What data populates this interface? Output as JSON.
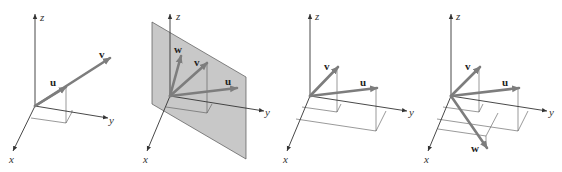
{
  "figure": {
    "colors": {
      "vector": "#7d7d7d",
      "axis": "#333333",
      "plane": "#c8c8c8",
      "background": "#ffffff"
    },
    "panels": [
      {
        "id": "panel-1",
        "axes": {
          "x": "x",
          "y": "y",
          "z": "z"
        },
        "vectors": [
          {
            "name": "u",
            "label": "u"
          },
          {
            "name": "v",
            "label": "v"
          }
        ],
        "note": "u and v are collinear (v is a scalar multiple of u)"
      },
      {
        "id": "panel-2",
        "axes": {
          "x": "x",
          "y": "y",
          "z": "z"
        },
        "vectors": [
          {
            "name": "w",
            "label": "w"
          },
          {
            "name": "v",
            "label": "v"
          },
          {
            "name": "u",
            "label": "u"
          }
        ],
        "note": "u, v, w lie in a shaded plane through the origin"
      },
      {
        "id": "panel-3",
        "axes": {
          "x": "x",
          "y": "y",
          "z": "z"
        },
        "vectors": [
          {
            "name": "v",
            "label": "v"
          },
          {
            "name": "u",
            "label": "u"
          }
        ]
      },
      {
        "id": "panel-4",
        "axes": {
          "x": "x",
          "y": "y",
          "z": "z"
        },
        "vectors": [
          {
            "name": "v",
            "label": "v"
          },
          {
            "name": "u",
            "label": "u"
          },
          {
            "name": "w",
            "label": "w"
          }
        ],
        "note": "w lies outside the plane of u and v"
      }
    ]
  }
}
